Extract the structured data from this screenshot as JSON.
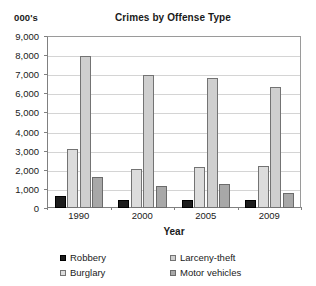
{
  "unit_label": "000's",
  "axis_title_x": "Year",
  "chart_data": {
    "type": "bar",
    "title": "Crimes by Offense Type",
    "xlabel": "Year",
    "ylabel": "000's",
    "categories": [
      "1990",
      "2000",
      "2005",
      "2009"
    ],
    "ylim": [
      0,
      9000
    ],
    "ytick_step": 1000,
    "yticks": [
      "9,000",
      "8,000",
      "7,000",
      "6,000",
      "5,000",
      "4,000",
      "3,000",
      "2,000",
      "1,000",
      "0"
    ],
    "ytick_values": [
      9000,
      8000,
      7000,
      6000,
      5000,
      4000,
      3000,
      2000,
      1000,
      0
    ],
    "grid": true,
    "legend_position": "bottom",
    "series": [
      {
        "name": "Robbery",
        "key": "robbery",
        "color": "#1c1c1c",
        "values": [
          640,
          408,
          417,
          408
        ]
      },
      {
        "name": "Burglary",
        "key": "burglary",
        "color": "#dcdcdc",
        "values": [
          3074,
          2051,
          2155,
          2200
        ]
      },
      {
        "name": "Larceny-theft",
        "key": "larceny",
        "color": "#cfcfcf",
        "values": [
          7946,
          6972,
          6784,
          6328
        ]
      },
      {
        "name": "Motor vehicles",
        "key": "motor",
        "color": "#a8a8a8",
        "values": [
          1636,
          1160,
          1236,
          795
        ]
      }
    ]
  },
  "legend": {
    "items": [
      {
        "label": "Robbery",
        "key": "robbery"
      },
      {
        "label": "Larceny-theft",
        "key": "larceny"
      },
      {
        "label": "Burglary",
        "key": "burglary"
      },
      {
        "label": "Motor vehicles",
        "key": "motor"
      }
    ]
  }
}
